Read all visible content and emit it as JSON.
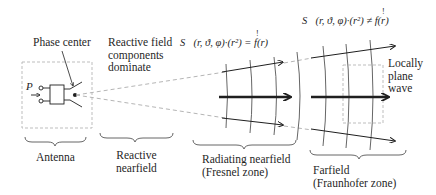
{
  "diagram": {
    "labels": {
      "phase_center": "Phase center",
      "reactive_components": "Reactive field\ncomponents\ndominate",
      "port": "P",
      "locally_plane_wave": "Locally\nplane\nwave"
    },
    "formulas": {
      "nearfield": "S⃗(r, ϑ, φ)·(r²) = f(r)",
      "nearfield_mark": "!",
      "farfield": "S⃗(r, ϑ, φ)·(r²) ≠ f(r)",
      "farfield_mark": "!"
    },
    "regions": [
      {
        "id": "antenna",
        "label": "Antenna"
      },
      {
        "id": "reactive-nearfield",
        "label": "Reactive\nnearfield"
      },
      {
        "id": "radiating-nearfield",
        "label": "Radiating nearfield\n(Fresnel zone)"
      },
      {
        "id": "farfield",
        "label": "Farfield\n(Fraunhofer zone)"
      }
    ],
    "colors": {
      "ink": "#1f1f1f",
      "wavefront": "#555555",
      "dashed": "#b5b5b5"
    }
  }
}
